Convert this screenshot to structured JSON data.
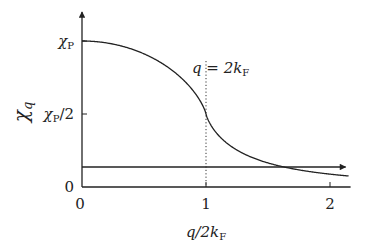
{
  "chart_data": {
    "type": "line",
    "title": "",
    "xlabel": "q/2k_F",
    "ylabel": "χ_q",
    "xlim": [
      0,
      2.15
    ],
    "ylim": [
      0,
      1.1
    ],
    "x_ticks": [
      {
        "value": 0,
        "label": "0"
      },
      {
        "value": 1,
        "label": "1"
      },
      {
        "value": 2,
        "label": "2"
      }
    ],
    "y_ticks": [
      {
        "value": 0,
        "label": "0"
      },
      {
        "value": 0.5,
        "label": "χP/2"
      },
      {
        "value": 1,
        "label": "χP"
      }
    ],
    "series": [
      {
        "name": "Lindhard susceptibility χ_q / χ_P",
        "formula": "1/2 + (1 - x^2)/(4x) * ln|(1+x)/(1-x)|",
        "x": [
          0,
          0.2,
          0.4,
          0.6,
          0.8,
          0.9,
          1.0,
          1.1,
          1.2,
          1.4,
          1.6,
          1.8,
          2.0,
          2.15
        ],
        "values": [
          1.0,
          0.987,
          0.946,
          0.873,
          0.75,
          0.659,
          0.5,
          0.377,
          0.309,
          0.217,
          0.161,
          0.123,
          0.088,
          0.07
        ]
      }
    ],
    "reference_lines": [
      {
        "type": "vertical",
        "x": 1,
        "style": "dotted",
        "label": "q = 2k_F"
      },
      {
        "type": "horizontal",
        "y": 0.137,
        "style": "solid-arrow"
      }
    ],
    "grid": false,
    "legend": "none"
  }
}
